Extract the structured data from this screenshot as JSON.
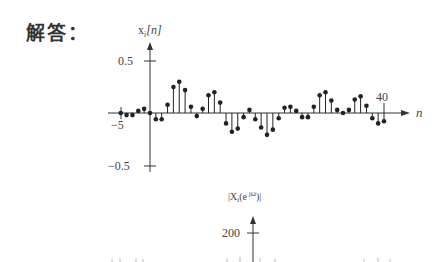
{
  "heading": {
    "label": "解答："
  },
  "chart_data": [
    {
      "type": "stem",
      "title": "",
      "ylabel": "x_i[n]",
      "xlabel": "n",
      "ylim": [
        -0.5,
        0.5
      ],
      "yticks": [
        0.5,
        -0.5
      ],
      "ytick_labels": [
        "0.5",
        "−0.5"
      ],
      "xtick_labels": [
        {
          "n": -5,
          "label": "−5"
        },
        {
          "n": 40,
          "label": "40"
        }
      ],
      "x": [
        -5,
        -4,
        -3,
        -2,
        -1,
        0,
        1,
        2,
        3,
        4,
        5,
        6,
        7,
        8,
        9,
        10,
        11,
        12,
        13,
        14,
        15,
        16,
        17,
        18,
        19,
        20,
        21,
        22,
        23,
        24,
        25,
        26,
        27,
        28,
        29,
        30,
        31,
        32,
        33,
        34,
        35,
        36,
        37,
        38,
        39,
        40
      ],
      "values": [
        0.0,
        -0.02,
        -0.02,
        0.02,
        0.04,
        0.0,
        -0.06,
        -0.06,
        0.08,
        0.25,
        0.3,
        0.22,
        0.06,
        -0.03,
        0.04,
        0.17,
        0.2,
        0.1,
        -0.1,
        -0.18,
        -0.15,
        -0.04,
        0.03,
        -0.06,
        -0.14,
        -0.21,
        -0.16,
        -0.05,
        0.05,
        0.06,
        0.02,
        -0.04,
        -0.04,
        0.06,
        0.17,
        0.2,
        0.12,
        0.03,
        0.0,
        0.03,
        0.13,
        0.16,
        0.07,
        -0.05,
        -0.1,
        -0.08
      ]
    },
    {
      "type": "stem",
      "title": "",
      "ylabel": "|X_i(e^{jΩ})|",
      "yticks": [
        200
      ],
      "ytick_labels": [
        "200"
      ],
      "note": "chart cut off at bottom of image"
    }
  ],
  "plot1": {
    "ylabel_main": "x",
    "ylabel_sub": "i",
    "ylabel_arg": "[n]",
    "ytick_top": "0.5",
    "ytick_bottom": "−0.5",
    "xtick_left": "−5",
    "xtick_right": "40",
    "xlabel": "n"
  },
  "plot2": {
    "ylabel": "|X",
    "ylabel_sub": "i",
    "ylabel_rest": "(e",
    "ylabel_sup": " jΩ",
    "ylabel_end": ")|",
    "ytick": "200"
  }
}
